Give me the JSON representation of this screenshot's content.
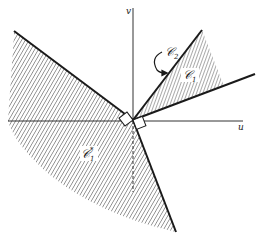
{
  "diagram": {
    "axes": {
      "horizontal_label": "u",
      "vertical_label": "v"
    },
    "regions": [
      {
        "id": "C1",
        "label": "𝒞",
        "subscript": "1",
        "description": "shaded cone between the two rays in the first quadrant"
      },
      {
        "id": "C1star",
        "label": "𝒞",
        "subscript": "1",
        "superscript": "*",
        "description": "shaded dual cone in the left/lower half-plane"
      }
    ],
    "annotation": {
      "label": "𝒞",
      "subscript": "2",
      "description": "curved arrow pointing to the upper boundary ray"
    },
    "colors": {
      "line": "#1a1a1a",
      "hatch": "#555555",
      "background": "#ffffff"
    }
  }
}
